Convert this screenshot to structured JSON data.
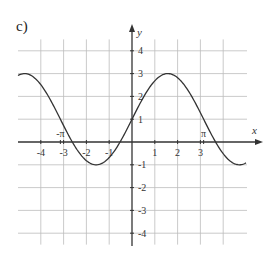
{
  "panel_label": "c)",
  "chart_data": {
    "type": "line",
    "title": "",
    "panel": "c)",
    "xlabel": "x",
    "ylabel": "y",
    "xlim": [
      -5,
      5
    ],
    "ylim": [
      -4.5,
      4.5
    ],
    "grid": true,
    "x_ticks": [
      -4,
      -3,
      -2,
      -1,
      1,
      2,
      3
    ],
    "y_ticks": [
      4,
      3,
      2,
      1,
      -1,
      -2,
      -3,
      -4
    ],
    "x_special_ticks": [
      {
        "label": "-π",
        "value": -3.14159
      },
      {
        "label": "π",
        "value": 3.14159
      }
    ],
    "series": [
      {
        "name": "y = 2 sin x + 1",
        "function": "2*sin(x)+1",
        "x": [
          -5.0,
          -4.71,
          -4,
          -3.14,
          -2.62,
          -2,
          -1.57,
          -1,
          -0.52,
          0,
          0.52,
          1,
          1.57,
          2,
          2.62,
          3.14,
          3.67,
          4,
          4.71,
          5.0
        ],
        "values": [
          2.92,
          3.0,
          2.51,
          1.0,
          0.0,
          -0.82,
          -1.0,
          -0.68,
          0.0,
          1.0,
          2.0,
          2.68,
          3.0,
          2.82,
          2.0,
          1.0,
          0.0,
          -0.51,
          -1.0,
          -0.92
        ]
      }
    ]
  }
}
